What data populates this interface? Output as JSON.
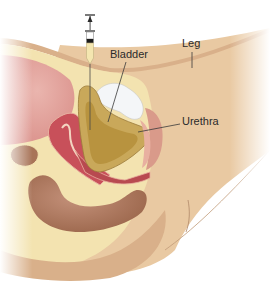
{
  "figure": {
    "labels": {
      "bladder": "Bladder",
      "leg": "Leg",
      "urethra": "Urethra"
    },
    "colors": {
      "background": "#ffffff",
      "skin": "#e9c9a2",
      "skin_shadow": "#d9b08a",
      "fat_tissue": "#f3e3b0",
      "bladder_wall": "#c9a85a",
      "bladder_lumen": "#b8933f",
      "bone_pubic": "#ffffff",
      "uterus": "#c8505a",
      "uterus_inner": "#a83a44",
      "bowel": "#a87458",
      "sacrum_upper": "#e6a8a0",
      "leader_line": "#3a3a3a",
      "syringe_fluid": "#f4e6b0"
    },
    "icons": {
      "syringe": "syringe-icon",
      "needle": "needle-icon"
    }
  }
}
